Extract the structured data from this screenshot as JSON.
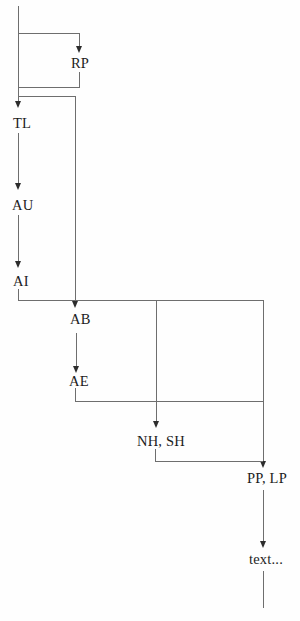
{
  "diagram": {
    "nodes": {
      "rp": {
        "label": "RP"
      },
      "tl": {
        "label": "TL"
      },
      "au": {
        "label": "AU"
      },
      "ai": {
        "label": "AI"
      },
      "ab": {
        "label": "AB"
      },
      "ae": {
        "label": "AE"
      },
      "nh_sh": {
        "label": "NH, SH"
      },
      "pp_lp": {
        "label": "PP, LP"
      },
      "more_text": {
        "label": "text..."
      }
    },
    "arrow_targets_top_to_bottom": [
      "RP",
      "TL",
      "AU",
      "AI",
      "AB",
      "AE",
      "NH, SH",
      "PP, LP",
      "text..."
    ],
    "edges": [
      {
        "from": "start",
        "to": "RP",
        "type": "branch-right-then-down"
      },
      {
        "from": "RP",
        "to": "trunk",
        "type": "return-left"
      },
      {
        "from": "trunk",
        "to": "TL",
        "type": "down"
      },
      {
        "from": "TL",
        "to": "AU",
        "type": "down"
      },
      {
        "from": "AU",
        "to": "AI",
        "type": "down"
      },
      {
        "from": "trunk",
        "to": "AB",
        "type": "branch-right-then-down"
      },
      {
        "from": "AB",
        "to": "AE",
        "type": "down"
      },
      {
        "from": "AI",
        "to": "NH, SH",
        "type": "branch-right-then-down"
      },
      {
        "from": "AI",
        "to": "PP, LP",
        "type": "branch-right-then-down"
      },
      {
        "from": "AE",
        "to": "PP, LP",
        "type": "right-join"
      },
      {
        "from": "NH, SH",
        "to": "PP, LP",
        "type": "right-join"
      },
      {
        "from": "PP, LP",
        "to": "text...",
        "type": "down"
      }
    ],
    "colors": {
      "line": "#6e6e6e",
      "arrowhead": "#2c2c2c",
      "text": "#1c1c1c",
      "background": "#fefefe"
    }
  }
}
